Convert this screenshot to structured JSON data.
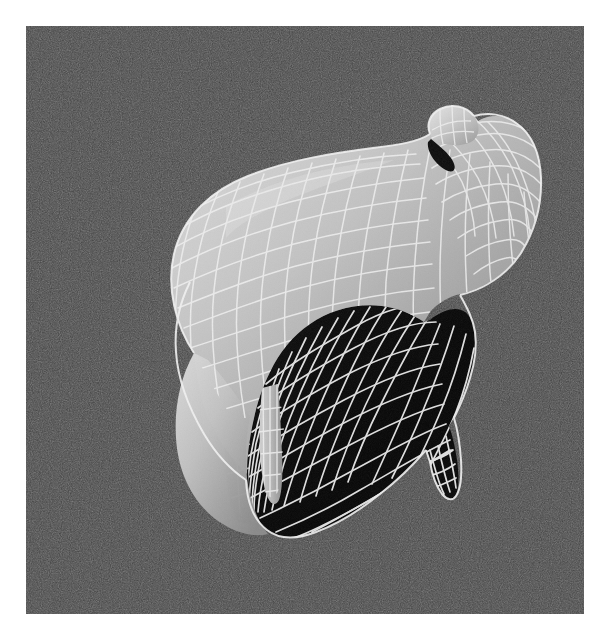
{
  "page": {
    "width": 605,
    "height": 639,
    "outer_background": "#ffffff"
  },
  "render_panel": {
    "name": "viewport",
    "x": 26,
    "y": 26,
    "width": 558,
    "height": 588,
    "background_color": "#3b3b3b",
    "background_description": "uniform dark gray with heavy monochrome film grain / noise",
    "noise_amount": 0.55
  },
  "subject": {
    "name": "sheep",
    "description": "Low-polygon / subdivision-surface quadruped (sheep or lamb) rendered as a shaded surface overlaid with a white quad wireframe mesh.",
    "orientation": "three-quarter view, head toward upper right, rump toward lower left, slightly tilted",
    "render_style": "shaded surface + wireframe overlay",
    "wireframe_color": "#f2f2f2",
    "wireframe_line_width": 1.6,
    "lit_surface_color": "#b9b9b9",
    "shadow_surface_color": "#0a0a0a",
    "highlight_color": "#e8e8e8",
    "mid_tone_color": "#8f8f8f",
    "mesh_grid": {
      "u_divisions": 22,
      "v_divisions": 16,
      "quad_topology": true
    },
    "parts": [
      {
        "name": "head",
        "shading": "lit",
        "note": "upper right, tapering muzzle pointing right"
      },
      {
        "name": "ear",
        "shading": "lit",
        "note": "small pointed lobe on upper-left of head"
      },
      {
        "name": "eye-crease",
        "shading": "shadow",
        "note": "dark notch beneath the ear"
      },
      {
        "name": "neck",
        "shading": "lit",
        "note": "thick column joining head to body"
      },
      {
        "name": "back",
        "shading": "lit",
        "note": "broad convex topline running upper-left to upper-right"
      },
      {
        "name": "body",
        "shading": "lit",
        "note": "large barrel-shaped torso, left half brightly lit"
      },
      {
        "name": "rump",
        "shading": "lit",
        "note": "rounded rear at left"
      },
      {
        "name": "belly",
        "shading": "shadow",
        "note": "underside in deep shadow, wireframe reads as white grid on black"
      },
      {
        "name": "foreleg-near",
        "shading": "lit",
        "note": "pale front leg, center of image"
      },
      {
        "name": "foreleg-far",
        "shading": "shadow",
        "note": "dark front leg left of the near foreleg"
      },
      {
        "name": "hindleg-near",
        "shading": "shadow",
        "note": "dark rear leg at lower right with pointed hoof"
      },
      {
        "name": "hindleg-far",
        "shading": "shadow",
        "note": "partially occluded rear leg"
      },
      {
        "name": "chest",
        "shading": "shadow",
        "note": "shadowed chest / shoulder region below the neck"
      }
    ],
    "lighting": {
      "key_light_direction": "upper left",
      "contrast": "very high — lit areas mid-gray, shadow areas near black",
      "ambient": "low"
    }
  },
  "chart_data": {
    "type": "table",
    "categories": [
      "background",
      "lit surface",
      "mid tone",
      "shadow surface",
      "wireframe"
    ],
    "values": [
      "#3b3b3b",
      "#b9b9b9",
      "#8f8f8f",
      "#0a0a0a",
      "#f2f2f2"
    ]
  }
}
